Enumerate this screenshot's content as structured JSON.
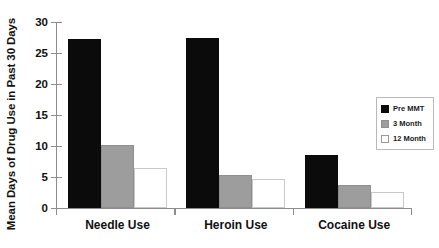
{
  "chart_data": {
    "type": "bar",
    "title": "",
    "xlabel": "",
    "ylabel": "Mean Days of Drug Use in Past 30 Days",
    "categories": [
      "Needle Use",
      "Heroin Use",
      "Cocaine Use"
    ],
    "series": [
      {
        "name": "Pre MMT",
        "color": "#0b0b0b",
        "values": [
          27.2,
          27.5,
          8.6
        ]
      },
      {
        "name": "3 Month",
        "color": "#9d9d9d",
        "values": [
          10.2,
          5.4,
          3.7
        ]
      },
      {
        "name": "12 Month",
        "color": "#ffffff",
        "values": [
          6.4,
          4.6,
          2.6
        ]
      }
    ],
    "ylim": [
      0,
      30
    ],
    "yticks": [
      0,
      5,
      10,
      15,
      20,
      25,
      30
    ],
    "ytick_labels": [
      "0",
      "5",
      "10",
      "15",
      "20",
      "25",
      "30"
    ],
    "grid": false,
    "legend_position": "right"
  },
  "legend": {
    "items": [
      {
        "label": "Pre MMT",
        "swatch": "black-swatch-icon"
      },
      {
        "label": "3 Month",
        "swatch": "gray-swatch-icon"
      },
      {
        "label": "12 Month",
        "swatch": "white-swatch-icon"
      }
    ]
  }
}
